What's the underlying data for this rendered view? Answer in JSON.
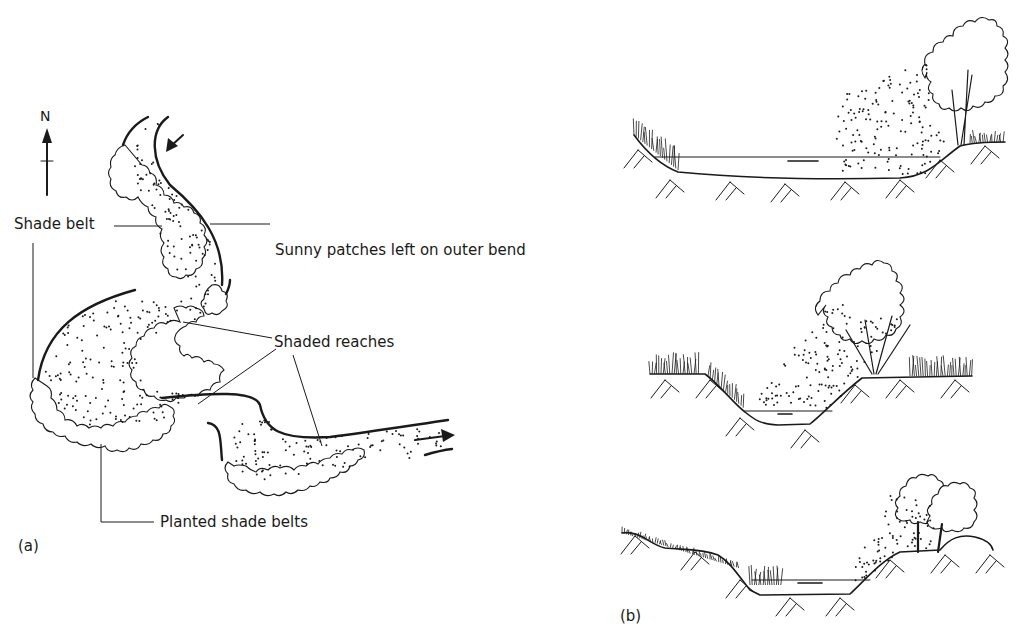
{
  "figure": {
    "panels": [
      {
        "id": "a",
        "tag": "(a)",
        "type": "plan-view-river",
        "compass": {
          "label": "N",
          "direction": "up"
        },
        "flow_arrows": [
          "inflow-top-south-west",
          "outflow-east"
        ],
        "labels": {
          "shade_belt": "Shade belt",
          "sunny_patches": "Sunny patches left on outer bend",
          "shaded_reaches": "Shaded reaches",
          "planted_shade_belts": "Planted shade belts"
        }
      },
      {
        "id": "b",
        "tag": "(b)",
        "type": "channel-cross-sections",
        "sections": [
          {
            "name": "wide-shallow-channel",
            "tree_side": "right",
            "trees": 1
          },
          {
            "name": "narrow-deep-channel",
            "tree_side": "right",
            "trees": 1
          },
          {
            "name": "berm-channel",
            "tree_side": "right",
            "trees": 2
          }
        ]
      }
    ]
  }
}
